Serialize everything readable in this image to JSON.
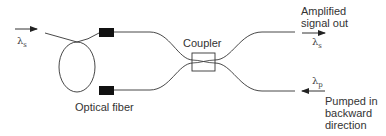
{
  "diagram": {
    "type": "optical fiber amplifier schematic (backward pumping)",
    "labels": {
      "input_signal": "λ",
      "input_signal_sub": "s",
      "optical_fiber": "Optical fiber",
      "coupler": "Coupler",
      "output_line1": "Amplified",
      "output_line2": "signal out",
      "output_signal": "λ",
      "output_signal_sub": "s",
      "pump_signal": "λ",
      "pump_signal_sub": "p",
      "pump_line1": "Pumped in",
      "pump_line2": "backward",
      "pump_line3": "direction"
    },
    "nodes": [
      {
        "id": "input",
        "label": "λs input"
      },
      {
        "id": "fiber-loop",
        "label": "Optical fiber"
      },
      {
        "id": "splice-upper",
        "label": ""
      },
      {
        "id": "splice-lower",
        "label": ""
      },
      {
        "id": "coupler",
        "label": "Coupler"
      },
      {
        "id": "output",
        "label": "Amplified signal out λs"
      },
      {
        "id": "pump",
        "label": "λp Pumped in backward direction"
      }
    ],
    "edges": [
      {
        "from": "input",
        "to": "fiber-loop"
      },
      {
        "from": "fiber-loop",
        "to": "splice-upper"
      },
      {
        "from": "fiber-loop",
        "to": "splice-lower"
      },
      {
        "from": "splice-upper",
        "to": "coupler"
      },
      {
        "from": "splice-lower",
        "to": "coupler"
      },
      {
        "from": "coupler",
        "to": "output"
      },
      {
        "from": "pump",
        "to": "coupler"
      }
    ],
    "colors": {
      "line": "#333333",
      "splice": "#111111",
      "background": "#ffffff"
    }
  }
}
